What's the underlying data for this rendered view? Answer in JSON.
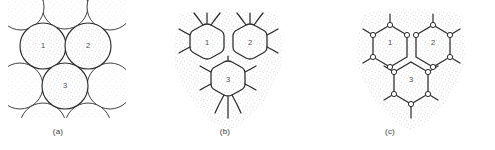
{
  "figure": {
    "type": "scientific-diagram",
    "background_color": "#ffffff",
    "line_color": "#2b2b2b",
    "stipple_color": "#9a9a9a",
    "label_color": "#3a3a3a",
    "panels": [
      {
        "id": "a",
        "label": "(a)",
        "style": "tangent-circles",
        "cells": [
          {
            "number": "1",
            "cx": 43,
            "cy": 46,
            "r": 23
          },
          {
            "number": "2",
            "cx": 88,
            "cy": 46,
            "r": 23
          },
          {
            "number": "3",
            "cx": 65,
            "cy": 86,
            "r": 23
          }
        ],
        "neighbor_cells": [
          {
            "cx": 65,
            "cy": 6,
            "r": 23
          },
          {
            "cx": 20,
            "cy": 86,
            "r": 23
          },
          {
            "cx": 110,
            "cy": 86,
            "r": 23
          },
          {
            "cx": 21,
            "cy": 7,
            "r": 23
          },
          {
            "cx": 110,
            "cy": 7,
            "r": 23
          }
        ]
      },
      {
        "id": "b",
        "label": "(b)",
        "style": "rounded-polygons-curved-junctions",
        "cells": [
          {
            "number": "1",
            "cx": 207,
            "cy": 47
          },
          {
            "number": "2",
            "cx": 250,
            "cy": 47
          },
          {
            "number": "3",
            "cx": 228,
            "cy": 84
          }
        ],
        "hex_radius": 25,
        "corner_round": 5
      },
      {
        "id": "c",
        "label": "(c)",
        "style": "straight-hexagons-vertex-nodes",
        "cells": [
          {
            "number": "1",
            "cx": 390,
            "cy": 47
          },
          {
            "number": "2",
            "cx": 433,
            "cy": 47
          },
          {
            "number": "3",
            "cx": 411,
            "cy": 84
          }
        ],
        "hex_radius": 25,
        "node_radius": 2.6
      }
    ]
  }
}
